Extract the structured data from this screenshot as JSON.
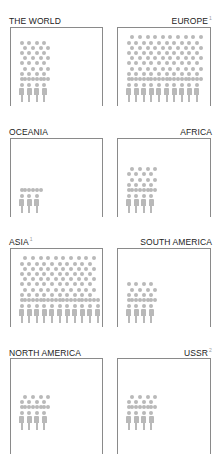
{
  "chart_data": {
    "type": "pictogram",
    "title": "",
    "colors": {
      "figure": "#b9b9b9",
      "border": "#8a8a8a",
      "label": "#222222"
    },
    "panels": [
      {
        "id": "world",
        "label": "THE WORLD",
        "footnote": "",
        "align": "left",
        "figures": 4,
        "partial_figure": false,
        "dot_cols": 4,
        "dot_rows": 8
      },
      {
        "id": "europe",
        "label": "EUROPE",
        "footnote": "1",
        "align": "right",
        "figures": 10,
        "partial_figure": true,
        "dot_cols": 10,
        "dot_rows": 9
      },
      {
        "id": "oceania",
        "label": "OCEANIA",
        "footnote": "",
        "align": "left",
        "figures": 3,
        "partial_figure": false,
        "dot_cols": 3,
        "dot_rows": 1
      },
      {
        "id": "africa",
        "label": "AFRICA",
        "footnote": "",
        "align": "right",
        "figures": 4,
        "partial_figure": false,
        "dot_cols": 4,
        "dot_rows": 5
      },
      {
        "id": "asia",
        "label": "ASIA",
        "footnote": "1",
        "align": "left",
        "figures": 11,
        "partial_figure": true,
        "dot_cols": 11,
        "dot_rows": 9
      },
      {
        "id": "south-america",
        "label": "SOUTH AMERICA",
        "footnote": "",
        "align": "right",
        "figures": 4,
        "partial_figure": false,
        "dot_cols": 4,
        "dot_rows": 4
      },
      {
        "id": "north-america",
        "label": "NORTH AMERICA",
        "footnote": "",
        "align": "left",
        "figures": 4,
        "partial_figure": false,
        "dot_cols": 4,
        "dot_rows": 3
      },
      {
        "id": "ussr",
        "label": "USSR",
        "footnote": "2",
        "align": "right",
        "figures": 4,
        "partial_figure": false,
        "dot_cols": 4,
        "dot_rows": 3
      }
    ]
  }
}
